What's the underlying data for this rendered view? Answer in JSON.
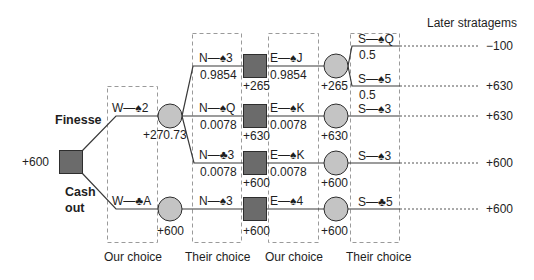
{
  "title": "Later stratagems",
  "root": {
    "value": "+600"
  },
  "choices": {
    "finesse": "Finesse",
    "cash_out_line1": "Cash",
    "cash_out_line2": "out"
  },
  "columns": [
    "Our choice",
    "Their choice",
    "Our choice",
    "Their choice"
  ],
  "level1": [
    {
      "move": "W—♠2",
      "node_value": "+270.73"
    },
    {
      "move": "W—♣A",
      "node_value": "+600"
    }
  ],
  "level2": [
    {
      "move": "N—♠3",
      "prob": "0.9854",
      "node_value": "+265"
    },
    {
      "move": "N—♠Q",
      "prob": "0.0078",
      "node_value": "+630"
    },
    {
      "move": "N—♣3",
      "prob": "0.0078",
      "node_value": "+600"
    },
    {
      "move": "N—♠3",
      "prob": "",
      "node_value": "+600"
    }
  ],
  "level3": [
    {
      "move": "E—♠J",
      "prob": "0.9854",
      "node_value": "+265"
    },
    {
      "move": "E—♠K",
      "prob": "0.0078",
      "node_value": "+630"
    },
    {
      "move": "E—♠K",
      "prob": "0.0078",
      "node_value": "+600"
    },
    {
      "move": "E—♠4",
      "prob": "",
      "node_value": "+600"
    }
  ],
  "level4": [
    {
      "move": "S—♠Q",
      "prob": "0.5",
      "outcome": "−100"
    },
    {
      "move": "S—♠5",
      "prob": "0.5",
      "outcome": "+630"
    },
    {
      "move": "S—♠3",
      "prob": "",
      "outcome": "+630"
    },
    {
      "move": "S—♠3",
      "prob": "",
      "outcome": "+600"
    },
    {
      "move": "S—♣5",
      "prob": "",
      "outcome": "+600"
    }
  ],
  "colors": {
    "square": "#6b6b6b",
    "circle": "#c4c4c4",
    "line": "#3a3a3a",
    "dash": "#9a9a9a"
  }
}
